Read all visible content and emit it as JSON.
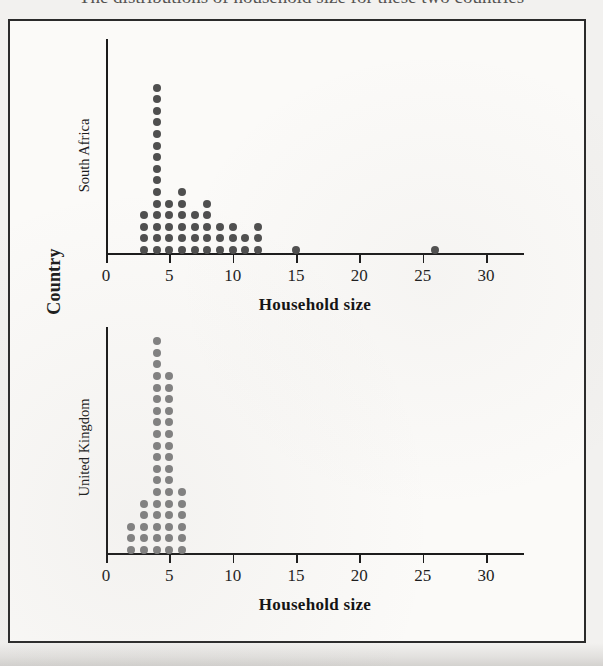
{
  "page": {
    "caption_partial": "The distributions of household size for these two countries"
  },
  "figure": {
    "y_axis_label": "Country",
    "panels": [
      {
        "name": "south-africa",
        "label": "South Africa",
        "dot_color": "#4f4f4f",
        "axis_title": "Household size"
      },
      {
        "name": "united-kingdom",
        "label": "United Kingdom",
        "dot_color": "#818181",
        "axis_title": "Household size"
      }
    ],
    "axis": {
      "title": "Household size",
      "ticks": [
        0,
        5,
        10,
        15,
        20,
        25,
        30
      ],
      "tick_labels": [
        "0",
        "5",
        "10",
        "15",
        "20",
        "25",
        "30"
      ],
      "xmin": 0,
      "xmax": 33
    }
  },
  "chart_data": {
    "type": "scatter",
    "plot_style": "stacked-dot-plot",
    "title": "",
    "subtitle": "",
    "xlabel": "Household size",
    "ylabel": "Country",
    "xlim": [
      0,
      33
    ],
    "xticks": [
      0,
      5,
      10,
      15,
      20,
      25,
      30
    ],
    "grid": false,
    "legend": "none",
    "facets": [
      {
        "name": "South Africa",
        "color": "#4f4f4f",
        "x": [
          3,
          4,
          5,
          6,
          7,
          8,
          9,
          10,
          11,
          12,
          15,
          26
        ],
        "counts": [
          4,
          15,
          5,
          6,
          4,
          5,
          3,
          3,
          2,
          3,
          1,
          1
        ],
        "total": 52
      },
      {
        "name": "United Kingdom",
        "color": "#818181",
        "x": [
          2,
          3,
          4,
          5,
          6
        ],
        "counts": [
          3,
          5,
          19,
          16,
          6
        ],
        "total": 49
      }
    ]
  }
}
